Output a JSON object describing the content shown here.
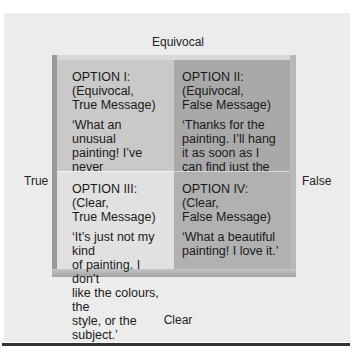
{
  "diagram": {
    "axes": {
      "top": "Equivocal",
      "bottom": "Clear",
      "left": "True",
      "right": "False"
    },
    "quadrants": [
      {
        "title": "OPTION I:\n(Equivocal,\nTrue Message)",
        "quote": "‘What an unusual\npainting! I’ve never\nseen anything\nlike it!’",
        "color": "#c9c9c9"
      },
      {
        "title": "OPTION II:\n(Equivocal,\nFalse Message)",
        "quote": "‘Thanks for the\npainting. I’ll hang\nit as soon as I\ncan find just the\nright place.’",
        "color": "#a9a9a9"
      },
      {
        "title": "OPTION III:\n(Clear,\nTrue Message)",
        "quote": "‘It’s just not my kind\nof painting. I don’t\nlike the colours, the\nstyle, or the subject.’",
        "color": "#e1e1e1"
      },
      {
        "title": "OPTION IV:\n(Clear,\nFalse Message)",
        "quote": "‘What a beautiful\npainting! I love it.’",
        "color": "#b1b1b1"
      }
    ]
  }
}
